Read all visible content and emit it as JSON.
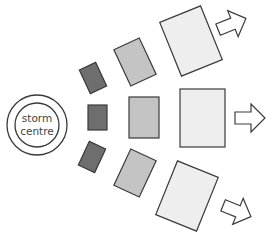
{
  "diagram": {
    "centre_label_line1": "storm",
    "centre_label_line2": "centre",
    "colors": {
      "outline": "#3a3a3a",
      "inner_band": "#6e6e6e",
      "middle_band": "#c4c4c4",
      "outer_band": "#eeeeee",
      "arrow_fill": "#ffffff"
    },
    "bands": [
      {
        "name": "inner",
        "shade": "dark grey"
      },
      {
        "name": "middle",
        "shade": "medium grey"
      },
      {
        "name": "outer",
        "shade": "light grey"
      }
    ],
    "directions": [
      "upper-right",
      "right",
      "lower-right"
    ]
  }
}
